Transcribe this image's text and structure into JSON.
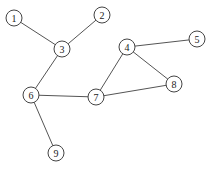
{
  "graph": {
    "node_radius": 8,
    "colors": {
      "edge": "#555555",
      "node_stroke": "#444444",
      "node_fill": "#ffffff",
      "label": "#222222"
    },
    "nodes": [
      {
        "id": "1",
        "label": "1",
        "x": 14,
        "y": 18
      },
      {
        "id": "2",
        "label": "2",
        "x": 102,
        "y": 15
      },
      {
        "id": "3",
        "label": "3",
        "x": 62,
        "y": 49
      },
      {
        "id": "4",
        "label": "4",
        "x": 127,
        "y": 47
      },
      {
        "id": "5",
        "label": "5",
        "x": 197,
        "y": 39
      },
      {
        "id": "6",
        "label": "6",
        "x": 31,
        "y": 95
      },
      {
        "id": "7",
        "label": "7",
        "x": 96,
        "y": 97
      },
      {
        "id": "8",
        "label": "8",
        "x": 174,
        "y": 84
      },
      {
        "id": "9",
        "label": "9",
        "x": 56,
        "y": 153
      }
    ],
    "edges": [
      [
        "1",
        "3"
      ],
      [
        "2",
        "3"
      ],
      [
        "3",
        "6"
      ],
      [
        "6",
        "7"
      ],
      [
        "6",
        "9"
      ],
      [
        "7",
        "4"
      ],
      [
        "4",
        "5"
      ],
      [
        "4",
        "8"
      ],
      [
        "7",
        "8"
      ]
    ]
  }
}
